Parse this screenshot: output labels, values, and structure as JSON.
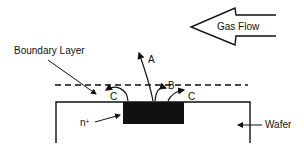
{
  "diagram": {
    "gas_flow_label": "Gas Flow",
    "boundary_layer_label": "Boundary Layer",
    "wafer_label": "Wafer",
    "region_label": "n",
    "region_superscript": "+",
    "path_labels": {
      "a": "A",
      "b": "B",
      "c_left": "C",
      "c_right": "C"
    },
    "colors": {
      "ink": "#111111",
      "background": "#ffffff"
    }
  }
}
